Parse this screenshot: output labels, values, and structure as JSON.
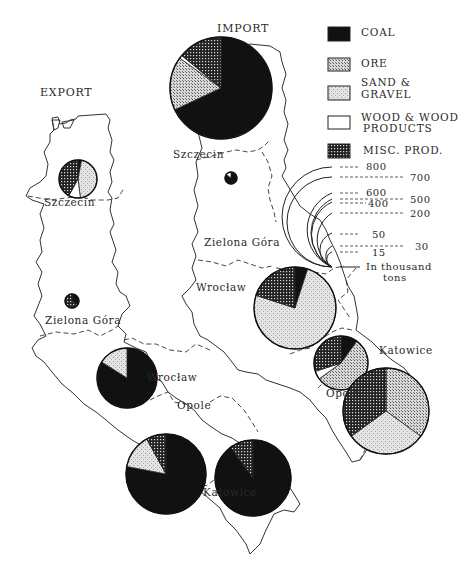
{
  "titles": {
    "import": "IMPORT",
    "export": "EXPORT"
  },
  "legend": {
    "items": [
      {
        "key": "coal",
        "label1": "COAL",
        "label2": ""
      },
      {
        "key": "ore",
        "label1": "ORE",
        "label2": ""
      },
      {
        "key": "sand",
        "label1": "SAND &",
        "label2": "GRAVEL"
      },
      {
        "key": "wood",
        "label1": "WOOD & WOOD",
        "label2": "PRODUCTS"
      },
      {
        "key": "misc",
        "label1": "MISC. PROD.",
        "label2": ""
      }
    ]
  },
  "scale": {
    "values": [
      "800",
      "700",
      "600",
      "500",
      "400",
      "200",
      "50",
      "30",
      "15"
    ],
    "unit_line1": "In thousand",
    "unit_line2": "tons"
  },
  "import_labels": {
    "szczecin": "Szczecin",
    "zielona_gora": "Zielona Góra",
    "wroclaw": "Wrocław",
    "opole": "Opole",
    "katowice": "Katowice"
  },
  "export_labels": {
    "szczecin": "Szczecin",
    "zielona_gora": "Zielona Góra",
    "wroclaw": "Wrocław",
    "opole": "Opole",
    "katowice": "Katowice"
  },
  "chart_data": {
    "type": "pie",
    "unit": "thousand tons (circle area)",
    "categories": [
      "Coal",
      "Ore",
      "Sand & Gravel",
      "Wood & Wood Products",
      "Misc. Prod."
    ],
    "scale_legend": [
      800,
      700,
      600,
      500,
      400,
      200,
      50,
      30,
      15
    ],
    "import": [
      {
        "region": "Szczecin",
        "total_approx": 800,
        "shares_pct": {
          "Coal": 68,
          "Ore": 17,
          "Sand & Gravel": 0,
          "Wood & Wood Products": 1,
          "Misc. Prod.": 14
        }
      },
      {
        "region": "Zielona Góra",
        "total_approx": 15,
        "shares_pct": {
          "Coal": 85,
          "Ore": 0,
          "Sand & Gravel": 0,
          "Wood & Wood Products": 15,
          "Misc. Prod.": 0
        }
      },
      {
        "region": "Wrocław",
        "total_approx": 400,
        "shares_pct": {
          "Coal": 5,
          "Ore": 0,
          "Sand & Gravel": 75,
          "Wood & Wood Products": 0,
          "Misc. Prod.": 20
        }
      },
      {
        "region": "Opole",
        "total_approx": 200,
        "shares_pct": {
          "Coal": 10,
          "Ore": 55,
          "Sand & Gravel": 0,
          "Wood & Wood Products": 5,
          "Misc. Prod.": 30
        }
      },
      {
        "region": "Katowice",
        "total_approx": 500,
        "shares_pct": {
          "Coal": 0,
          "Ore": 35,
          "Sand & Gravel": 30,
          "Wood & Wood Products": 0,
          "Misc. Prod.": 35
        }
      }
    ],
    "export": [
      {
        "region": "Szczecin",
        "total_approx": 50,
        "shares_pct": {
          "Coal": 3,
          "Ore": 0,
          "Sand & Gravel": 45,
          "Wood & Wood Products": 10,
          "Misc. Prod.": 42
        }
      },
      {
        "region": "Zielona Góra",
        "total_approx": 15,
        "shares_pct": {
          "Coal": 35,
          "Ore": 0,
          "Sand & Gravel": 0,
          "Wood & Wood Products": 0,
          "Misc. Prod.": 65
        }
      },
      {
        "region": "Wrocław",
        "total_approx": 500,
        "shares_pct": {
          "Coal": 84,
          "Ore": 0,
          "Sand & Gravel": 16,
          "Wood & Wood Products": 0,
          "Misc. Prod.": 0
        }
      },
      {
        "region": "Opole",
        "total_approx": 700,
        "shares_pct": {
          "Coal": 78,
          "Ore": 0,
          "Sand & Gravel": 14,
          "Wood & Wood Products": 0,
          "Misc. Prod.": 8
        }
      },
      {
        "region": "Katowice",
        "total_approx": 700,
        "shares_pct": {
          "Coal": 90,
          "Ore": 0,
          "Sand & Gravel": 0,
          "Wood & Wood Products": 0,
          "Misc. Prod.": 10
        }
      }
    ]
  }
}
